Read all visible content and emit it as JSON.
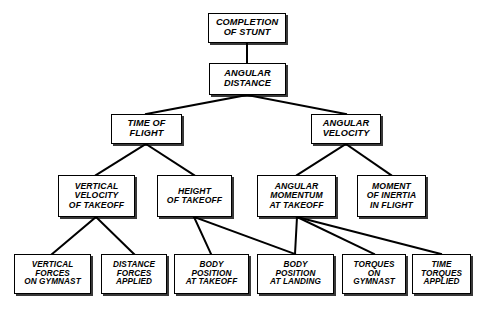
{
  "diagram": {
    "type": "hierarchy-tree",
    "background_color": "#ffffff",
    "line_color": "#000000",
    "box_fill": "#ffffff",
    "nodes": [
      {
        "id": "completion-of-stunt",
        "label": "COMPLETION\nOF STUNT",
        "level": 0,
        "x": 208,
        "y": 13,
        "w": 78,
        "h": 30
      },
      {
        "id": "angular-distance",
        "label": "ANGULAR\nDISTANCE",
        "level": 1,
        "x": 209,
        "y": 63,
        "w": 77,
        "h": 32
      },
      {
        "id": "time-of-flight",
        "label": "TIME OF\nFLIGHT",
        "level": 2,
        "x": 111,
        "y": 114,
        "w": 71,
        "h": 30
      },
      {
        "id": "angular-velocity",
        "label": "ANGULAR\nVELOCITY",
        "level": 2,
        "x": 311,
        "y": 114,
        "w": 70,
        "h": 30
      },
      {
        "id": "vertical-velocity-of-takeoff",
        "label": "VERTICAL\nVELOCITY\nOF TAKEOFF",
        "level": 3,
        "x": 58,
        "y": 175,
        "w": 77,
        "h": 42
      },
      {
        "id": "height-of-takeoff",
        "label": "HEIGHT\nOF TAKEOFF",
        "level": 3,
        "x": 157,
        "y": 175,
        "w": 75,
        "h": 42
      },
      {
        "id": "angular-momentum-at-takeoff",
        "label": "ANGULAR\nMOMENTUM\nAT TAKEOFF",
        "level": 3,
        "x": 257,
        "y": 175,
        "w": 79,
        "h": 42
      },
      {
        "id": "moment-of-inertia-in-flight",
        "label": "MOMENT\nOF INERTIA\nIN FLIGHT",
        "level": 3,
        "x": 357,
        "y": 175,
        "w": 69,
        "h": 42
      },
      {
        "id": "vertical-forces-on-gymnast",
        "label": "VERTICAL\nFORCES\nON GYMNAST",
        "level": 4,
        "x": 14,
        "y": 254,
        "w": 77,
        "h": 40
      },
      {
        "id": "distance-forces-applied",
        "label": "DISTANCE\nFORCES\nAPPLIED",
        "level": 4,
        "x": 101,
        "y": 254,
        "w": 66,
        "h": 40
      },
      {
        "id": "body-position-at-takeoff",
        "label": "BODY\nPOSITION\nAT TAKEOFF",
        "level": 4,
        "x": 174,
        "y": 254,
        "w": 75,
        "h": 40
      },
      {
        "id": "body-position-at-landing",
        "label": "BODY\nPOSITION\nAT LANDING",
        "level": 4,
        "x": 257,
        "y": 254,
        "w": 77,
        "h": 40
      },
      {
        "id": "torques-on-gymnast",
        "label": "TORQUES\nON\nGYMNAST",
        "level": 4,
        "x": 342,
        "y": 254,
        "w": 64,
        "h": 40
      },
      {
        "id": "time-torques-applied",
        "label": "TIME\nTORQUES\nAPPLIED",
        "level": 4,
        "x": 412,
        "y": 254,
        "w": 59,
        "h": 40
      }
    ],
    "edges": [
      {
        "from": "completion-of-stunt",
        "to": "angular-distance",
        "x1": 247,
        "y1": 43,
        "x2": 247,
        "y2": 63
      },
      {
        "from": "angular-distance",
        "to": "time-of-flight",
        "x1": 247,
        "y1": 95,
        "x2": 146,
        "y2": 114
      },
      {
        "from": "angular-distance",
        "to": "angular-velocity",
        "x1": 247,
        "y1": 95,
        "x2": 346,
        "y2": 114
      },
      {
        "from": "time-of-flight",
        "to": "vertical-velocity-of-takeoff",
        "x1": 146,
        "y1": 144,
        "x2": 96,
        "y2": 175
      },
      {
        "from": "time-of-flight",
        "to": "height-of-takeoff",
        "x1": 146,
        "y1": 144,
        "x2": 194,
        "y2": 175
      },
      {
        "from": "angular-velocity",
        "to": "angular-momentum-at-takeoff",
        "x1": 346,
        "y1": 144,
        "x2": 297,
        "y2": 175
      },
      {
        "from": "angular-velocity",
        "to": "moment-of-inertia-in-flight",
        "x1": 346,
        "y1": 144,
        "x2": 391,
        "y2": 175
      },
      {
        "from": "vertical-velocity-of-takeoff",
        "to": "vertical-forces-on-gymnast",
        "x1": 96,
        "y1": 217,
        "x2": 52,
        "y2": 254
      },
      {
        "from": "vertical-velocity-of-takeoff",
        "to": "distance-forces-applied",
        "x1": 96,
        "y1": 217,
        "x2": 134,
        "y2": 254
      },
      {
        "from": "height-of-takeoff",
        "to": "body-position-at-takeoff",
        "x1": 194,
        "y1": 217,
        "x2": 211,
        "y2": 254
      },
      {
        "from": "height-of-takeoff",
        "to": "body-position-at-landing",
        "x1": 194,
        "y1": 217,
        "x2": 295,
        "y2": 254
      },
      {
        "from": "angular-momentum-at-takeoff",
        "to": "body-position-at-landing",
        "x1": 297,
        "y1": 217,
        "x2": 295,
        "y2": 254
      },
      {
        "from": "angular-momentum-at-takeoff",
        "to": "torques-on-gymnast",
        "x1": 297,
        "y1": 217,
        "x2": 374,
        "y2": 254
      },
      {
        "from": "angular-momentum-at-takeoff",
        "to": "time-torques-applied",
        "x1": 297,
        "y1": 217,
        "x2": 441,
        "y2": 254
      }
    ]
  }
}
